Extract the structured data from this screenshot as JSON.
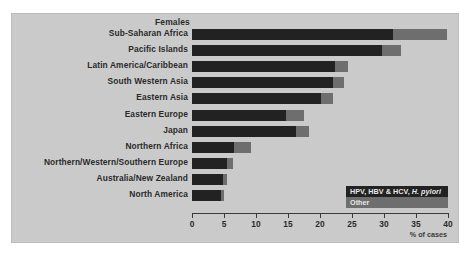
{
  "chart_data": {
    "type": "bar",
    "orientation": "horizontal",
    "stacked": true,
    "title": "Females",
    "xlabel": "% of cases",
    "ylabel": "",
    "xlim": [
      0,
      40
    ],
    "xticks": [
      0,
      5,
      10,
      15,
      20,
      25,
      30,
      35,
      40
    ],
    "grid": false,
    "legend_position": "inside-bottom-right",
    "categories": [
      "Sub-Saharan Africa",
      "Pacific Islands",
      "Latin America/Caribbean",
      "South Western Asia",
      "Eastern Asia",
      "Eastern Europe",
      "Japan",
      "Northern Africa",
      "Northern/Western/Southern Europe",
      "Australia/New Zealand",
      "North America"
    ],
    "series": [
      {
        "name": "HPV, HBV & HCV, H. pylori",
        "color": "#222222",
        "values": [
          31.4,
          29.7,
          22.3,
          22.0,
          20.2,
          14.7,
          16.3,
          6.6,
          5.5,
          4.8,
          4.5
        ]
      },
      {
        "name": "Other",
        "color": "#6e6e6e",
        "values": [
          8.4,
          3.0,
          2.1,
          1.8,
          1.8,
          2.8,
          2.0,
          2.6,
          0.9,
          0.7,
          0.5
        ]
      }
    ],
    "legend": [
      {
        "label_html": "HPV, HBV &amp; HCV, <i>H. pylori</i>",
        "label": "HPV, HBV & HCV, H. pylori",
        "color": "#222222"
      },
      {
        "label_html": "Other",
        "label": "Other",
        "color": "#6e6e6e"
      }
    ]
  },
  "colors": {
    "panel_background": "#cdcdcd",
    "page_background": "#ffffff",
    "primary_series": "#222222",
    "other_series": "#6e6e6e",
    "axis": "#3a3a3a",
    "text": "#2b2b2b"
  }
}
